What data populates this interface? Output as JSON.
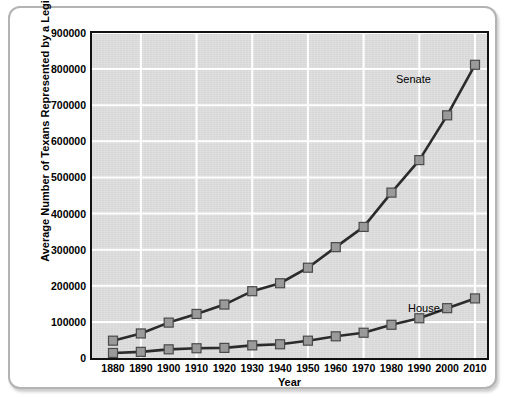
{
  "chart_data": {
    "type": "line",
    "title": "",
    "xlabel": "Year",
    "ylabel": "Average Number of Texans Represented by a Legislator",
    "x": [
      1880,
      1890,
      1900,
      1910,
      1920,
      1930,
      1940,
      1950,
      1960,
      1970,
      1980,
      1990,
      2000,
      2010
    ],
    "xtick_labels": [
      "1880",
      "1890",
      "1900",
      "1910",
      "1920",
      "1930",
      "1940",
      "1950",
      "1960",
      "1970",
      "1980",
      "1990",
      "2000",
      "2010"
    ],
    "ytick_labels": [
      "0",
      "100000",
      "200000",
      "300000",
      "400000",
      "500000",
      "600000",
      "700000",
      "800000",
      "900000"
    ],
    "ytick_values": [
      0,
      100000,
      200000,
      300000,
      400000,
      500000,
      600000,
      700000,
      800000,
      900000
    ],
    "xlim": [
      1880,
      2010
    ],
    "ylim": [
      0,
      900000
    ],
    "grid": true,
    "legend_position": "inline-annotation",
    "series": [
      {
        "name": "Senate",
        "values": [
          48000,
          68000,
          98000,
          122000,
          148000,
          185000,
          207000,
          250000,
          307000,
          363000,
          458000,
          548000,
          672000,
          812000
        ],
        "color": "#2b2b2b",
        "marker": "square",
        "marker_color": "#9a9a9a"
      },
      {
        "name": "House",
        "values": [
          14000,
          17000,
          24000,
          27000,
          28000,
          35000,
          38000,
          48000,
          60000,
          70000,
          92000,
          110000,
          138000,
          165000
        ],
        "color": "#2b2b2b",
        "marker": "square",
        "marker_color": "#9a9a9a"
      }
    ],
    "annotations": [
      {
        "text": "Senate",
        "series": "Senate"
      },
      {
        "text": "House",
        "series": "House"
      }
    ]
  },
  "style": {
    "plot_background": "#dcdcdc",
    "gridline_color": "#ffffff",
    "axis_color": "#111111",
    "card_border": "#b3b3b3",
    "page_background": "#ffffff",
    "line_color": "#2b2b2b",
    "marker_fill": "#9a9a9a",
    "marker_stroke": "#4a4a4a"
  }
}
